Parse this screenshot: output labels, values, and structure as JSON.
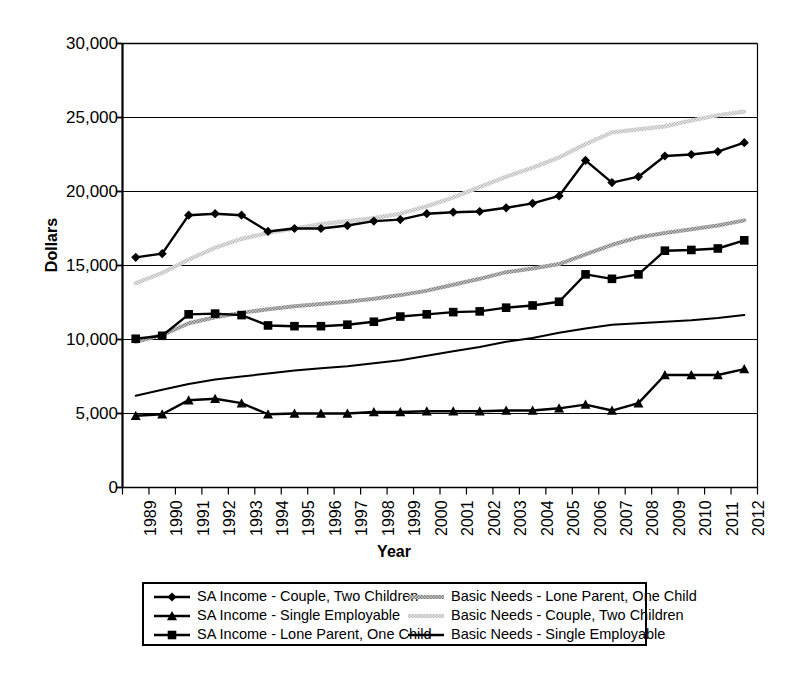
{
  "chart_data": {
    "type": "line",
    "title": "",
    "xlabel": "Year",
    "ylabel": "Dollars",
    "ylim": [
      0,
      30000
    ],
    "ytick_labels": [
      "30,000",
      "25,000",
      "20,000",
      "15,000",
      "10,000",
      "5,000",
      "0"
    ],
    "ytick_values": [
      30000,
      25000,
      20000,
      15000,
      10000,
      5000,
      0
    ],
    "grid": true,
    "legend_position": "bottom",
    "categories": [
      "1989",
      "1990",
      "1991",
      "1992",
      "1993",
      "1994",
      "1995",
      "1996",
      "1997",
      "1998",
      "1999",
      "2000",
      "2001",
      "2002",
      "2003",
      "2004",
      "2005",
      "2006",
      "2007",
      "2008",
      "2009",
      "2010",
      "2011",
      "2012"
    ],
    "series": [
      {
        "name": "SA Income - Couple, Two Children",
        "marker": "diamond",
        "style": "solid-black-marker",
        "color": "#000000",
        "values": [
          15550,
          15800,
          18400,
          18500,
          18400,
          17300,
          17500,
          17500,
          17700,
          18000,
          18100,
          18500,
          18600,
          18650,
          18900,
          19200,
          19700,
          22100,
          20600,
          21000,
          22400,
          22500,
          22700,
          23300
        ]
      },
      {
        "name": "SA Income - Single Employable",
        "marker": "triangle",
        "style": "solid-black-marker",
        "color": "#000000",
        "values": [
          4850,
          4950,
          5900,
          6000,
          5700,
          4950,
          5000,
          5000,
          5000,
          5100,
          5100,
          5150,
          5150,
          5150,
          5200,
          5200,
          5350,
          5600,
          5200,
          5700,
          7600,
          7600,
          7600,
          8000
        ]
      },
      {
        "name": "SA Income - Lone Parent, One Child",
        "marker": "square",
        "style": "solid-black-marker",
        "color": "#000000",
        "values": [
          10050,
          10250,
          11700,
          11750,
          11650,
          10950,
          10900,
          10900,
          11000,
          11200,
          11550,
          11700,
          11850,
          11900,
          12150,
          12300,
          12550,
          14400,
          14100,
          14400,
          16000,
          16050,
          16150,
          16700
        ]
      },
      {
        "name": "Basic Needs - Lone Parent, One Child",
        "marker": "none",
        "style": "gray-hatched",
        "color": "#8a8a8a",
        "values": [
          9850,
          10300,
          11100,
          11500,
          11800,
          12050,
          12250,
          12400,
          12550,
          12750,
          13000,
          13300,
          13700,
          14100,
          14550,
          14800,
          15100,
          15750,
          16400,
          16900,
          17200,
          17450,
          17700,
          18050
        ]
      },
      {
        "name": "Basic Needs - Couple, Two Children",
        "marker": "none",
        "style": "light-gray-hatched",
        "color": "#b5b5b5",
        "values": [
          13800,
          14500,
          15400,
          16200,
          16800,
          17200,
          17500,
          17800,
          18000,
          18200,
          18500,
          19000,
          19600,
          20300,
          21000,
          21600,
          22300,
          23200,
          24000,
          24200,
          24400,
          24800,
          25150,
          25400
        ]
      },
      {
        "name": "Basic Needs - Single Employable",
        "marker": "none",
        "style": "thin-solid-black",
        "color": "#000000",
        "values": [
          6200,
          6600,
          7000,
          7300,
          7500,
          7700,
          7900,
          8050,
          8200,
          8400,
          8600,
          8900,
          9200,
          9500,
          9850,
          10100,
          10450,
          10750,
          11000,
          11100,
          11200,
          11300,
          11450,
          11650
        ]
      }
    ],
    "legend": {
      "left_column": [
        {
          "label": "SA Income - Couple, Two Children",
          "marker": "diamond",
          "style": "solid-black-marker"
        },
        {
          "label": "SA Income - Single Employable",
          "marker": "triangle",
          "style": "solid-black-marker"
        },
        {
          "label": "SA Income - Lone Parent, One Child",
          "marker": "square",
          "style": "solid-black-marker"
        }
      ],
      "right_column": [
        {
          "label": "Basic Needs - Lone Parent, One Child",
          "marker": "none",
          "style": "gray-hatched"
        },
        {
          "label": "Basic Needs - Couple, Two Children",
          "marker": "none",
          "style": "light-gray-hatched"
        },
        {
          "label": "Basic Needs - Single Employable",
          "marker": "none",
          "style": "thin-solid-black"
        }
      ]
    }
  }
}
